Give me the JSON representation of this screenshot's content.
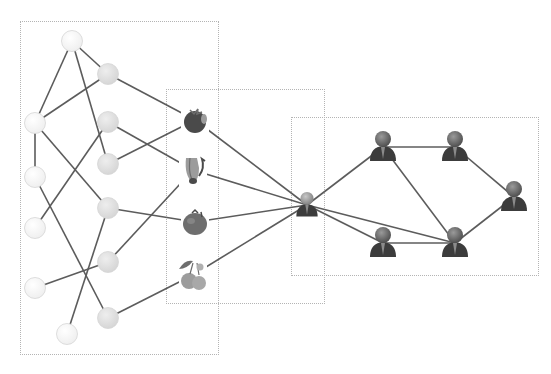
{
  "diagram": {
    "title": "",
    "colors": {
      "edge": "#5c5c5c",
      "box_border": "#b4b4b4",
      "feature_node_light": "#f4f4f4",
      "feature_node_mid": "#e2e2e2",
      "node_stroke": "#d6d6d6",
      "person_body": "#3c3c3c",
      "person_head": "#7a7a7a",
      "center_head": "#a0a0a0",
      "fruit_dark": "#4a4a4a",
      "fruit_mid": "#6e6e6e",
      "fruit_light": "#9c9c9c"
    },
    "boxes": [
      {
        "id": "box-feature-graph",
        "x": 20,
        "y": 21,
        "w": 199,
        "h": 334
      },
      {
        "id": "box-items",
        "x": 166,
        "y": 89,
        "w": 159,
        "h": 215
      },
      {
        "id": "box-social-graph",
        "x": 291,
        "y": 117,
        "w": 248,
        "h": 159
      }
    ],
    "nodes": [
      {
        "id": "L0",
        "type": "feature-light",
        "x": 72,
        "y": 41
      },
      {
        "id": "L1",
        "type": "feature-light",
        "x": 35,
        "y": 123
      },
      {
        "id": "L2",
        "type": "feature-light",
        "x": 35,
        "y": 177
      },
      {
        "id": "L3",
        "type": "feature-light",
        "x": 35,
        "y": 228
      },
      {
        "id": "L4",
        "type": "feature-light",
        "x": 35,
        "y": 288
      },
      {
        "id": "L5",
        "type": "feature-light",
        "x": 67,
        "y": 334
      },
      {
        "id": "M0",
        "type": "feature-mid",
        "x": 108,
        "y": 74
      },
      {
        "id": "M1",
        "type": "feature-mid",
        "x": 108,
        "y": 122
      },
      {
        "id": "M2",
        "type": "feature-mid",
        "x": 108,
        "y": 164
      },
      {
        "id": "M3",
        "type": "feature-mid",
        "x": 108,
        "y": 208
      },
      {
        "id": "M4",
        "type": "feature-mid",
        "x": 108,
        "y": 262
      },
      {
        "id": "M5",
        "type": "feature-mid",
        "x": 108,
        "y": 318
      },
      {
        "id": "F0",
        "type": "fruit",
        "icon": "strawberry-icon",
        "x": 195,
        "y": 120
      },
      {
        "id": "F1",
        "type": "fruit",
        "icon": "banana-icon",
        "x": 193,
        "y": 170
      },
      {
        "id": "F2",
        "type": "fruit",
        "icon": "tomato-icon",
        "x": 195,
        "y": 222
      },
      {
        "id": "F3",
        "type": "fruit",
        "icon": "cherries-icon",
        "x": 193,
        "y": 275
      },
      {
        "id": "U0",
        "type": "user-center",
        "icon": "user-icon",
        "x": 307,
        "y": 205
      },
      {
        "id": "U1",
        "type": "user",
        "icon": "user-icon",
        "x": 383,
        "y": 147
      },
      {
        "id": "U2",
        "type": "user",
        "icon": "user-icon",
        "x": 455,
        "y": 147
      },
      {
        "id": "U3",
        "type": "user",
        "icon": "user-icon",
        "x": 514,
        "y": 197
      },
      {
        "id": "U4",
        "type": "user",
        "icon": "user-icon",
        "x": 383,
        "y": 243
      },
      {
        "id": "U5",
        "type": "user",
        "icon": "user-icon",
        "x": 455,
        "y": 243
      }
    ],
    "edges": [
      [
        "L0",
        "L1"
      ],
      [
        "L0",
        "M0"
      ],
      [
        "L0",
        "M2"
      ],
      [
        "M0",
        "L1"
      ],
      [
        "M0",
        "F0"
      ],
      [
        "L1",
        "L2"
      ],
      [
        "L1",
        "M3"
      ],
      [
        "M1",
        "L3"
      ],
      [
        "M1",
        "F1"
      ],
      [
        "M2",
        "F0"
      ],
      [
        "L2",
        "M5"
      ],
      [
        "M3",
        "F2"
      ],
      [
        "M3",
        "L5"
      ],
      [
        "M4",
        "L4"
      ],
      [
        "M4",
        "F1"
      ],
      [
        "M5",
        "F3"
      ],
      [
        "F0",
        "U0"
      ],
      [
        "F1",
        "U0"
      ],
      [
        "F2",
        "U0"
      ],
      [
        "F3",
        "U0"
      ],
      [
        "U0",
        "U1"
      ],
      [
        "U0",
        "U5"
      ],
      [
        "U0",
        "U4"
      ],
      [
        "U1",
        "U2"
      ],
      [
        "U1",
        "U5"
      ],
      [
        "U2",
        "U3"
      ],
      [
        "U3",
        "U5"
      ],
      [
        "U4",
        "U5"
      ]
    ]
  }
}
